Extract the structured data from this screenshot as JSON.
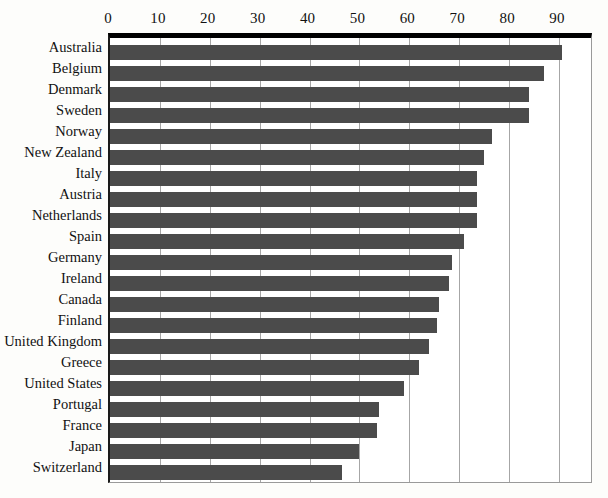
{
  "chart_data": {
    "type": "bar",
    "orientation": "horizontal",
    "title": "",
    "xlabel": "",
    "ylabel": "",
    "xlim": [
      0,
      97
    ],
    "ylim": null,
    "grid": true,
    "legend": null,
    "xticks": [
      0,
      10,
      20,
      30,
      40,
      50,
      60,
      70,
      80,
      90
    ],
    "xtick_labels": [
      "0",
      "10",
      "20",
      "30",
      "40",
      "50",
      "60",
      "70",
      "80",
      "90"
    ],
    "bar_color": "#4b4b4b",
    "categories": [
      "Australia",
      "Belgium",
      "Denmark",
      "Sweden",
      "Norway",
      "New Zealand",
      "Italy",
      "Austria",
      "Netherlands",
      "Spain",
      "Germany",
      "Ireland",
      "Canada",
      "Finland",
      "United Kingdom",
      "Greece",
      "United States",
      "Portugal",
      "France",
      "Japan",
      "Switzerland"
    ],
    "values": [
      90.5,
      87,
      84,
      84,
      76.5,
      75,
      73.5,
      73.5,
      73.5,
      71,
      68.5,
      68,
      66,
      65.5,
      64,
      62,
      59,
      54,
      53.5,
      50,
      46.5
    ]
  }
}
